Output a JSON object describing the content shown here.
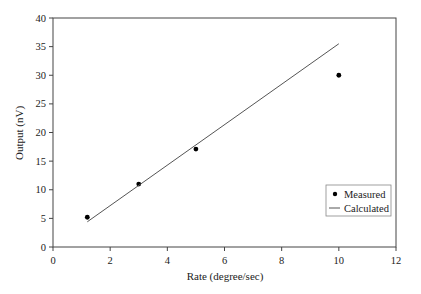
{
  "chart_data": {
    "type": "scatter",
    "title": "",
    "xlabel": "Rate (degree/sec)",
    "ylabel": "Output (nV)",
    "xlim": [
      0,
      12
    ],
    "ylim": [
      0,
      40
    ],
    "xticks": [
      0,
      2,
      4,
      6,
      8,
      10,
      12
    ],
    "yticks": [
      0,
      5,
      10,
      15,
      20,
      25,
      30,
      35,
      40
    ],
    "grid": false,
    "legend_position": "lower right",
    "series": [
      {
        "name": "Measured",
        "type": "scatter",
        "marker": "circle",
        "x": [
          1.2,
          3,
          5,
          10
        ],
        "y": [
          5.2,
          11,
          17.1,
          30
        ]
      },
      {
        "name": "Calculated",
        "type": "line",
        "x": [
          1.2,
          10
        ],
        "y": [
          4.4,
          35.5
        ]
      }
    ]
  },
  "colors": {
    "axis": "#444444",
    "marker": "#000000",
    "line": "#555555",
    "legend_border": "#888888"
  }
}
